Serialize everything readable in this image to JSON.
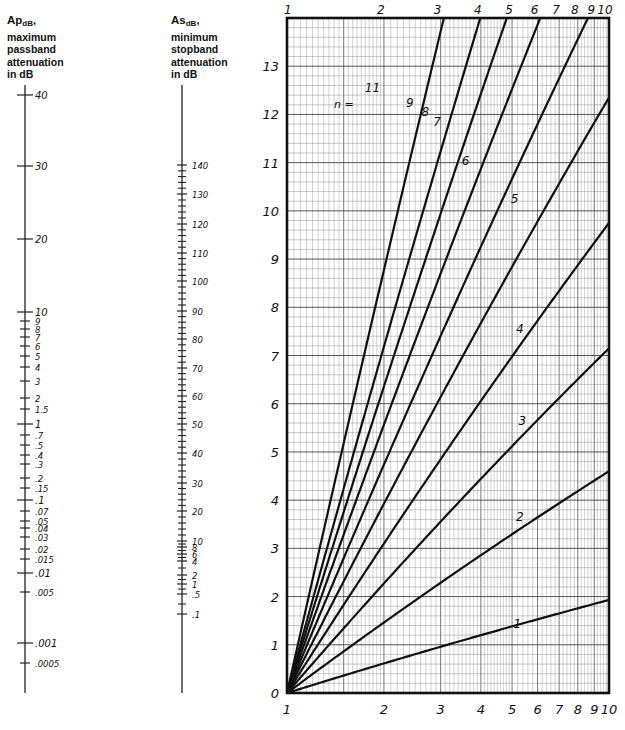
{
  "left_scale": {
    "title_main": "Ap",
    "title_sub": "dB",
    "title_lines": [
      "maximum",
      "passband",
      "attenuation",
      "in dB"
    ],
    "ticks": [
      {
        "label": "40",
        "y": 95,
        "major": true
      },
      {
        "label": "30",
        "y": 166,
        "major": true
      },
      {
        "label": "20",
        "y": 239,
        "major": true
      },
      {
        "label": "10",
        "y": 312,
        "major": true
      },
      {
        "label": "9",
        "y": 321
      },
      {
        "label": "8",
        "y": 329
      },
      {
        "label": "7",
        "y": 337
      },
      {
        "label": "6",
        "y": 346
      },
      {
        "label": "5",
        "y": 356
      },
      {
        "label": "4",
        "y": 367
      },
      {
        "label": "3",
        "y": 381
      },
      {
        "label": "2",
        "y": 398
      },
      {
        "label": "1.5",
        "y": 409
      },
      {
        "label": "1",
        "y": 424,
        "major": true
      },
      {
        "label": ".7",
        "y": 435
      },
      {
        "label": ".5",
        "y": 445
      },
      {
        "label": ".4",
        "y": 455
      },
      {
        "label": ".3",
        "y": 464
      },
      {
        "label": ".2",
        "y": 478
      },
      {
        "label": ".15",
        "y": 488
      },
      {
        "label": ".1",
        "y": 500,
        "major": true
      },
      {
        "label": ".07",
        "y": 511
      },
      {
        "label": ".05",
        "y": 521
      },
      {
        "label": ".04",
        "y": 528
      },
      {
        "label": ".03",
        "y": 537
      },
      {
        "label": ".02",
        "y": 549
      },
      {
        "label": ".015",
        "y": 559
      },
      {
        "label": ".01",
        "y": 573,
        "major": true
      },
      {
        "label": ".005",
        "y": 592
      },
      {
        "label": ".001",
        "y": 643,
        "major": true
      },
      {
        "label": ".0005",
        "y": 663
      }
    ],
    "axis_top": 85,
    "axis_bottom": 693
  },
  "right_scale": {
    "title_main": "As",
    "title_sub": "dB",
    "title_lines": [
      "minimum",
      "stopband",
      "attenuation",
      "in dB"
    ],
    "ticks": [
      {
        "label": "140",
        "y": 165
      },
      {
        "label": "130",
        "y": 194
      },
      {
        "label": "120",
        "y": 224
      },
      {
        "label": "110",
        "y": 253
      },
      {
        "label": "100",
        "y": 281
      },
      {
        "label": "90",
        "y": 311
      },
      {
        "label": "80",
        "y": 339
      },
      {
        "label": "70",
        "y": 368
      },
      {
        "label": "60",
        "y": 396
      },
      {
        "label": "50",
        "y": 424
      },
      {
        "label": "40",
        "y": 453
      },
      {
        "label": "30",
        "y": 483
      },
      {
        "label": "20",
        "y": 511
      },
      {
        "label": "10",
        "y": 541
      },
      {
        "label": "8",
        "y": 547
      },
      {
        "label": "6",
        "y": 554
      },
      {
        "label": "4",
        "y": 561
      },
      {
        "label": "2",
        "y": 575
      },
      {
        "label": "1",
        "y": 584
      },
      {
        "label": ".5",
        "y": 594
      },
      {
        "label": ".1",
        "y": 614
      }
    ],
    "axis_top": 85,
    "axis_bottom": 693
  },
  "chart_data": {
    "type": "line",
    "xlabel": "",
    "ylabel": "",
    "x_scale": "log",
    "xlim": [
      1,
      10
    ],
    "ylim": [
      0,
      14
    ],
    "x_tick_labels_top": [
      "1",
      "2",
      "3",
      "4",
      "5",
      "6",
      "7",
      "8",
      "9",
      "10"
    ],
    "x_tick_labels_bottom": [
      "1",
      "2",
      "3",
      "4",
      "5",
      "6",
      "7",
      "8",
      "9",
      "10"
    ],
    "y_tick_labels": [
      "0",
      "1",
      "2",
      "3",
      "4",
      "5",
      "6",
      "7",
      "8",
      "9",
      "10",
      "11",
      "12",
      "13"
    ],
    "grid": true,
    "annotation": "n =",
    "series": [
      {
        "name": "1",
        "y_at_10": 1.93,
        "label_pos": [
          5.5,
          1.4
        ]
      },
      {
        "name": "2",
        "y_at_10": 4.6,
        "label_pos": [
          5.6,
          3.6
        ]
      },
      {
        "name": "3",
        "y_at_10": 7.15,
        "label_pos": [
          5.7,
          5.6
        ]
      },
      {
        "name": "4",
        "y_at_10": 9.75,
        "label_pos": [
          5.6,
          7.5
        ]
      },
      {
        "name": "5",
        "y_at_10": 12.35,
        "label_pos": [
          5.4,
          10.2
        ]
      },
      {
        "name": "6",
        "y_at_10": 14.9,
        "label_pos": [
          3.8,
          11.0
        ]
      },
      {
        "name": "7",
        "y_at_10": 17.5,
        "label_pos": [
          3.1,
          11.8
        ]
      },
      {
        "name": "8",
        "y_at_10": 20.0,
        "label_pos": [
          2.85,
          12.0
        ]
      },
      {
        "name": "9",
        "y_at_10": 22.6,
        "label_pos": [
          2.55,
          12.2
        ]
      },
      {
        "name": "11",
        "y_at_10": 27.6,
        "label_pos": [
          1.9,
          12.5
        ]
      }
    ]
  }
}
